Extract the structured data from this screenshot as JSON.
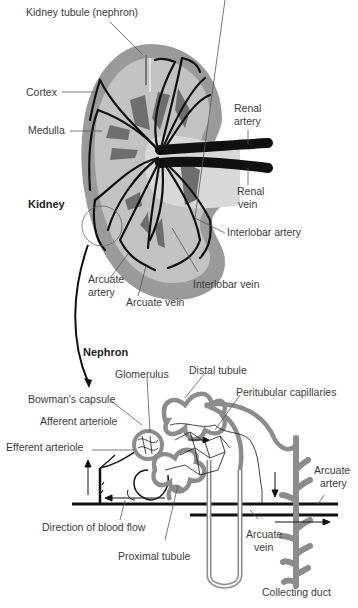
{
  "figure": {
    "kidney_section": {
      "title": "Kidney",
      "labels": {
        "kidney_tubule": "Kidney tubule (nephron)",
        "cortex": "Cortex",
        "medulla": "Medulla",
        "renal_artery_1": "Renal",
        "renal_artery_2": "artery",
        "renal_vein_1": "Renal",
        "renal_vein_2": "vein",
        "interlobar_artery": "Interlobar artery",
        "interlobar_vein": "Interlobar vein",
        "arcuate_artery_1": "Arcuate",
        "arcuate_artery_2": "artery",
        "arcuate_vein": "Arcuate vein"
      }
    },
    "nephron_section": {
      "title": "Nephron",
      "labels": {
        "glomerulus": "Glomerulus",
        "distal_tubule": "Distal tubule",
        "bowmans_capsule": "Bowman's capsule",
        "peritubular_capillaries": "Peritubular capillaries",
        "afferent_arteriole": "Afferent arteriole",
        "efferent_arteriole": "Efferent arteriole",
        "arcuate_artery_1": "Arcuate",
        "arcuate_artery_2": "artery",
        "direction_of_blood_flow": "Direction of blood flow",
        "arcuate_vein_1": "Arcuate",
        "arcuate_vein_2": "vein",
        "proximal_tubule": "Proximal tubule",
        "collecting_duct": "Collecting duct"
      }
    },
    "colors": {
      "cortex": "#9a9a9a",
      "medulla": "#c4c4c4",
      "pyramid": "#6e6e6e",
      "vessel": "#111111",
      "tubule": "#8c8c8c",
      "tubule_inner": "#f4f4f4",
      "leader": "#555555"
    }
  }
}
